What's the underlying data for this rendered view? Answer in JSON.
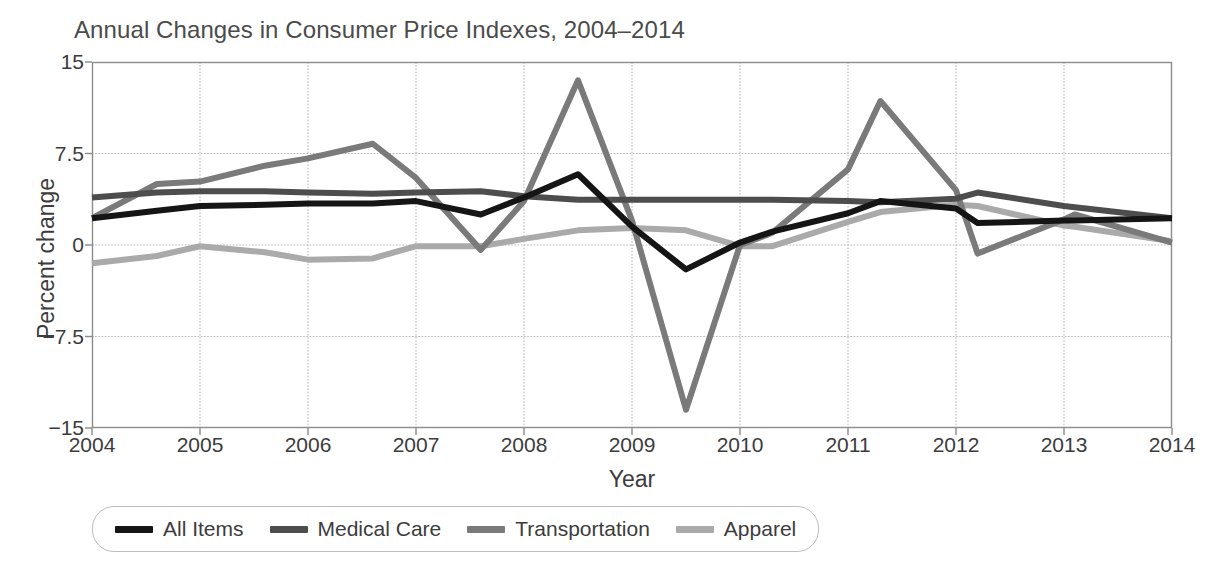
{
  "chart_data": {
    "type": "line",
    "title": "Annual Changes in Consumer Price Indexes, 2004–2014",
    "xlabel": "Year",
    "ylabel": "Percent change",
    "xlim": [
      2004,
      2014
    ],
    "ylim": [
      -15,
      15
    ],
    "xticks": [
      "2004",
      "2005",
      "2006",
      "2007",
      "2008",
      "2009",
      "2010",
      "2011",
      "2012",
      "2013",
      "2014"
    ],
    "yticks": [
      "15",
      "7.5",
      "0",
      "−7.5",
      "−15"
    ],
    "grid": true,
    "legend_position": "below-left",
    "x": [
      2004.0,
      2004.6,
      2005.0,
      2005.6,
      2006.0,
      2006.6,
      2007.0,
      2007.6,
      2008.0,
      2008.5,
      2009.0,
      2009.5,
      2010.0,
      2010.3,
      2011.0,
      2011.3,
      2012.0,
      2012.2,
      2013.0,
      2013.1,
      2014.0
    ],
    "series": [
      {
        "name": "All Items",
        "color": "#151515",
        "values": [
          2.2,
          2.8,
          3.2,
          3.3,
          3.4,
          3.4,
          3.6,
          2.5,
          3.9,
          5.8,
          1.5,
          -2.0,
          0.2,
          1.1,
          2.6,
          3.6,
          3.0,
          1.8,
          2.0,
          2.0,
          2.2
        ]
      },
      {
        "name": "Medical Care",
        "color": "#4d4d4d",
        "values": [
          3.9,
          4.3,
          4.4,
          4.4,
          4.3,
          4.2,
          4.3,
          4.4,
          4.0,
          3.7,
          3.7,
          3.7,
          3.7,
          3.7,
          3.6,
          3.5,
          3.8,
          4.3,
          3.2,
          3.1,
          2.2
        ]
      },
      {
        "name": "Transportation",
        "color": "#7a7a7a",
        "values": [
          2.2,
          5.0,
          5.2,
          6.5,
          7.1,
          8.3,
          5.5,
          -0.4,
          3.6,
          13.5,
          2.0,
          -13.5,
          0.0,
          1.0,
          6.2,
          11.8,
          4.5,
          -0.7,
          2.1,
          2.5,
          0.2
        ]
      },
      {
        "name": "Apparel",
        "color": "#aaaaaa",
        "values": [
          -1.5,
          -0.9,
          -0.1,
          -0.6,
          -1.2,
          -1.1,
          -0.1,
          -0.1,
          0.5,
          1.2,
          1.4,
          1.2,
          -0.1,
          -0.1,
          1.9,
          2.7,
          3.3,
          3.2,
          1.6,
          1.5,
          0.3
        ]
      }
    ]
  },
  "legend": {
    "items": [
      {
        "label": "All Items",
        "color": "#151515"
      },
      {
        "label": "Medical Care",
        "color": "#4d4d4d"
      },
      {
        "label": "Transportation",
        "color": "#7a7a7a"
      },
      {
        "label": "Apparel",
        "color": "#aaaaaa"
      }
    ]
  },
  "axes": {
    "frame_color": "#8c8c8c",
    "grid_color": "#b5b5b5"
  }
}
